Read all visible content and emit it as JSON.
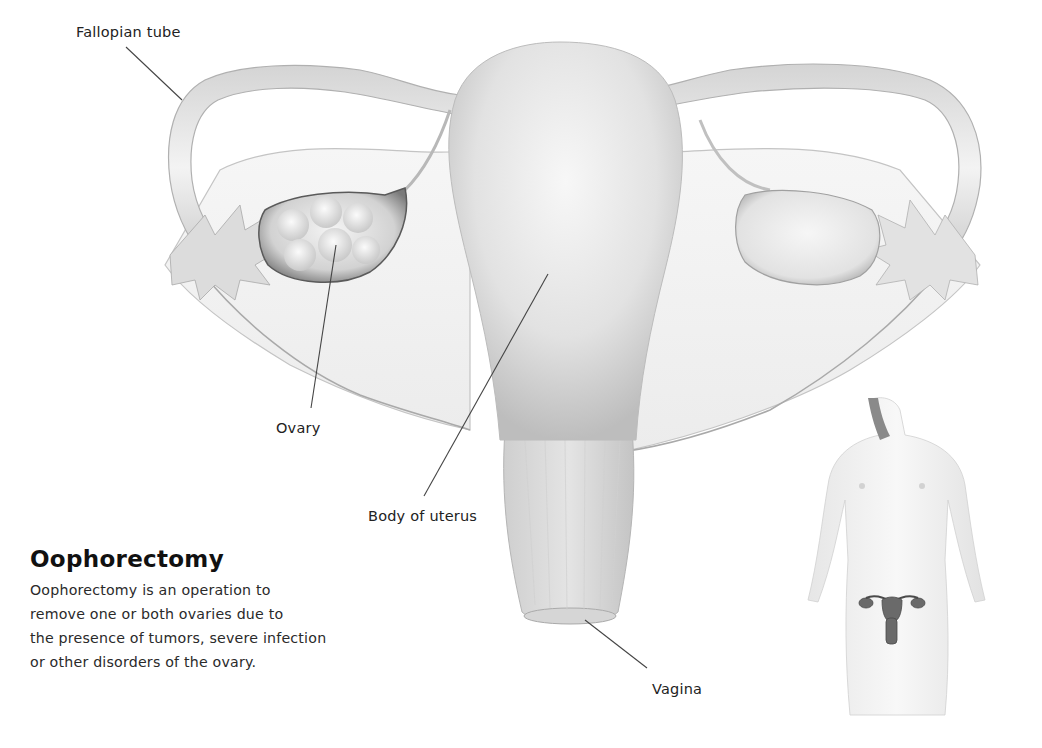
{
  "diagram": {
    "type": "anatomical-illustration",
    "labels": {
      "fallopian_tube": "Fallopian tube",
      "ovary": "Ovary",
      "body_of_uterus": "Body of uterus",
      "vagina": "Vagina"
    },
    "colors": {
      "background": "#ffffff",
      "tissue_light": "#f2f2f2",
      "tissue_mid": "#d6d6d6",
      "tissue_dark": "#9a9a9a",
      "leader_line": "#444444",
      "text": "#222222"
    }
  },
  "caption": {
    "title": "Oophorectomy",
    "lines": [
      "Oophorectomy is an operation to",
      "remove one or both ovaries due to",
      "the presence of tumors, severe infection",
      "or other disorders of the ovary."
    ]
  },
  "inset": {
    "description": "female figure with reproductive organs highlighted"
  }
}
